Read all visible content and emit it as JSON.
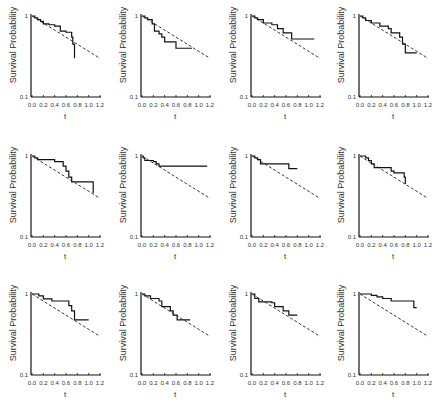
{
  "chart_data": [
    {
      "type": "line",
      "panel": 1,
      "ylabel": "Survival Probability",
      "xlabel": "t",
      "xticks": [
        "0.0",
        "0.2",
        "0.4",
        "0.6",
        "0.8",
        "1.0",
        "1.2"
      ],
      "yticks": [
        "0.1",
        "1"
      ],
      "yscale": "log",
      "xlim": [
        0,
        1.2
      ],
      "ylim": [
        0.1,
        1
      ],
      "series": [
        {
          "name": "Kaplan-Meier",
          "style": "solid",
          "x": [
            0,
            0.05,
            0.1,
            0.15,
            0.2,
            0.3,
            0.4,
            0.5,
            0.6,
            0.7,
            0.72,
            0.75
          ],
          "y": [
            1,
            0.95,
            0.9,
            0.86,
            0.8,
            0.78,
            0.75,
            0.65,
            0.63,
            0.55,
            0.45,
            0.3
          ]
        },
        {
          "name": "Exponential",
          "style": "dashed",
          "x": [
            0,
            1.2
          ],
          "y": [
            1,
            0.3
          ]
        }
      ]
    },
    {
      "type": "line",
      "panel": 2,
      "ylabel": "Survival Probability",
      "xlabel": "t",
      "xticks": [
        "0.0",
        "0.2",
        "0.4",
        "0.6",
        "0.8",
        "1.0",
        "1.2"
      ],
      "yticks": [
        "0.1",
        "1"
      ],
      "yscale": "log",
      "xlim": [
        0,
        1.2
      ],
      "ylim": [
        0.1,
        1
      ],
      "series": [
        {
          "name": "Kaplan-Meier",
          "style": "solid",
          "x": [
            0,
            0.05,
            0.1,
            0.18,
            0.22,
            0.3,
            0.35,
            0.4,
            0.6,
            0.88
          ],
          "y": [
            1,
            0.95,
            0.9,
            0.8,
            0.65,
            0.6,
            0.55,
            0.48,
            0.4,
            0.4
          ]
        },
        {
          "name": "Exponential",
          "style": "dashed",
          "x": [
            0,
            1.2
          ],
          "y": [
            1,
            0.3
          ]
        }
      ]
    },
    {
      "type": "line",
      "panel": 3,
      "ylabel": "Survival Probability",
      "xlabel": "t",
      "xticks": [
        "0.0",
        "0.2",
        "0.4",
        "0.6",
        "0.8",
        "1.0",
        "1.2"
      ],
      "yticks": [
        "0.1",
        "1"
      ],
      "yscale": "log",
      "xlim": [
        0,
        1.2
      ],
      "ylim": [
        0.1,
        1
      ],
      "series": [
        {
          "name": "Kaplan-Meier",
          "style": "solid",
          "x": [
            0,
            0.05,
            0.1,
            0.2,
            0.35,
            0.45,
            0.55,
            0.7,
            1.1
          ],
          "y": [
            1,
            0.95,
            0.9,
            0.82,
            0.78,
            0.7,
            0.62,
            0.52,
            0.52
          ]
        },
        {
          "name": "Exponential",
          "style": "dashed",
          "x": [
            0,
            1.2
          ],
          "y": [
            1,
            0.3
          ]
        }
      ]
    },
    {
      "type": "line",
      "panel": 4,
      "ylabel": "Survival Probability",
      "xlabel": "t",
      "xticks": [
        "0.0",
        "0.2",
        "0.4",
        "0.6",
        "0.8",
        "1.0",
        "1.2"
      ],
      "yticks": [
        "0.1",
        "1"
      ],
      "yscale": "log",
      "xlim": [
        0,
        1.2
      ],
      "ylim": [
        0.1,
        1
      ],
      "series": [
        {
          "name": "Kaplan-Meier",
          "style": "solid",
          "x": [
            0,
            0.05,
            0.1,
            0.2,
            0.35,
            0.5,
            0.55,
            0.7,
            0.75,
            0.8,
            1.0
          ],
          "y": [
            1,
            0.95,
            0.88,
            0.82,
            0.75,
            0.7,
            0.62,
            0.55,
            0.45,
            0.35,
            0.35
          ]
        },
        {
          "name": "Exponential",
          "style": "dashed",
          "x": [
            0,
            1.2
          ],
          "y": [
            1,
            0.3
          ]
        }
      ]
    },
    {
      "type": "line",
      "panel": 5,
      "ylabel": "Survival Probability",
      "xlabel": "t",
      "xticks": [
        "0.0",
        "0.2",
        "0.4",
        "0.6",
        "0.8",
        "1.0",
        "1.2"
      ],
      "yticks": [
        "0.1",
        "1"
      ],
      "yscale": "log",
      "xlim": [
        0,
        1.2
      ],
      "ylim": [
        0.1,
        1
      ],
      "series": [
        {
          "name": "Kaplan-Meier",
          "style": "solid",
          "x": [
            0,
            0.05,
            0.1,
            0.4,
            0.55,
            0.6,
            0.65,
            0.7,
            1.05,
            1.08
          ],
          "y": [
            1,
            0.95,
            0.9,
            0.85,
            0.75,
            0.65,
            0.55,
            0.48,
            0.48,
            0.35
          ]
        },
        {
          "name": "Exponential",
          "style": "dashed",
          "x": [
            0,
            1.2
          ],
          "y": [
            1,
            0.3
          ]
        }
      ]
    },
    {
      "type": "line",
      "panel": 6,
      "ylabel": "Survival Probability",
      "xlabel": "t",
      "xticks": [
        "0.0",
        "0.2",
        "0.4",
        "0.6",
        "0.8",
        "1.0",
        "1.2"
      ],
      "yticks": [
        "0.1",
        "1"
      ],
      "yscale": "log",
      "xlim": [
        0,
        1.2
      ],
      "ylim": [
        0.1,
        1
      ],
      "series": [
        {
          "name": "Kaplan-Meier",
          "style": "solid",
          "x": [
            0,
            0.02,
            0.05,
            0.2,
            0.25,
            0.3,
            1.15
          ],
          "y": [
            1,
            0.95,
            0.88,
            0.85,
            0.8,
            0.75,
            0.75
          ]
        },
        {
          "name": "Exponential",
          "style": "dashed",
          "x": [
            0,
            1.2
          ],
          "y": [
            1,
            0.3
          ]
        }
      ]
    },
    {
      "type": "line",
      "panel": 7,
      "ylabel": "Survival Probability",
      "xlabel": "t",
      "xticks": [
        "0.0",
        "0.2",
        "0.4",
        "0.6",
        "0.8",
        "1.0",
        "1.2"
      ],
      "yticks": [
        "0.1",
        "1"
      ],
      "yscale": "log",
      "xlim": [
        0,
        1.2
      ],
      "ylim": [
        0.1,
        1
      ],
      "series": [
        {
          "name": "Kaplan-Meier",
          "style": "solid",
          "x": [
            0,
            0.05,
            0.1,
            0.15,
            0.65,
            0.8
          ],
          "y": [
            1,
            0.95,
            0.9,
            0.8,
            0.7,
            0.7
          ]
        },
        {
          "name": "Exponential",
          "style": "dashed",
          "x": [
            0,
            1.2
          ],
          "y": [
            1,
            0.3
          ]
        }
      ]
    },
    {
      "type": "line",
      "panel": 8,
      "ylabel": "Survival Probability",
      "xlabel": "t",
      "xticks": [
        "0.0",
        "0.2",
        "0.4",
        "0.6",
        "0.8",
        "1.0",
        "1.2"
      ],
      "yticks": [
        "0.1",
        "1"
      ],
      "yscale": "log",
      "xlim": [
        0,
        1.2
      ],
      "ylim": [
        0.1,
        1
      ],
      "series": [
        {
          "name": "Kaplan-Meier",
          "style": "solid",
          "x": [
            0,
            0.1,
            0.15,
            0.2,
            0.25,
            0.55,
            0.6,
            0.78,
            0.8
          ],
          "y": [
            1,
            0.95,
            0.88,
            0.8,
            0.72,
            0.65,
            0.62,
            0.55,
            0.45
          ]
        },
        {
          "name": "Exponential",
          "style": "dashed",
          "x": [
            0,
            1.2
          ],
          "y": [
            1,
            0.3
          ]
        }
      ]
    },
    {
      "type": "line",
      "panel": 9,
      "ylabel": "Survival Probability",
      "xlabel": "t",
      "xticks": [
        "0.0",
        "0.2",
        "0.4",
        "0.6",
        "0.8",
        "1.0",
        "1.2"
      ],
      "yticks": [
        "0.1",
        "1"
      ],
      "yscale": "log",
      "xlim": [
        0,
        1.2
      ],
      "ylim": [
        0.1,
        1
      ],
      "series": [
        {
          "name": "Kaplan-Meier",
          "style": "solid",
          "x": [
            0,
            0.12,
            0.2,
            0.35,
            0.65,
            0.7,
            0.75,
            1.0
          ],
          "y": [
            1,
            0.95,
            0.87,
            0.82,
            0.72,
            0.62,
            0.48,
            0.48
          ]
        },
        {
          "name": "Exponential",
          "style": "dashed",
          "x": [
            0,
            1.2
          ],
          "y": [
            1,
            0.3
          ]
        }
      ]
    },
    {
      "type": "line",
      "panel": 10,
      "ylabel": "Survival Probability",
      "xlabel": "t",
      "xticks": [
        "0.0",
        "0.2",
        "0.4",
        "0.6",
        "0.8",
        "1.0",
        "1.2"
      ],
      "yticks": [
        "0.1",
        "1"
      ],
      "yscale": "log",
      "xlim": [
        0,
        1.2
      ],
      "ylim": [
        0.1,
        1
      ],
      "series": [
        {
          "name": "Kaplan-Meier",
          "style": "solid",
          "x": [
            0,
            0.05,
            0.15,
            0.3,
            0.35,
            0.5,
            0.55,
            0.62,
            0.85
          ],
          "y": [
            1,
            0.95,
            0.88,
            0.82,
            0.7,
            0.62,
            0.55,
            0.48,
            0.48
          ]
        },
        {
          "name": "Exponential",
          "style": "dashed",
          "x": [
            0,
            1.2
          ],
          "y": [
            1,
            0.3
          ]
        }
      ]
    },
    {
      "type": "line",
      "panel": 11,
      "ylabel": "Survival Probability",
      "xlabel": "t",
      "xticks": [
        "0.0",
        "0.2",
        "0.4",
        "0.6",
        "0.8",
        "1.0",
        "1.2"
      ],
      "yticks": [
        "0.1",
        "1"
      ],
      "yscale": "log",
      "xlim": [
        0,
        1.2
      ],
      "ylim": [
        0.1,
        1
      ],
      "series": [
        {
          "name": "Kaplan-Meier",
          "style": "solid",
          "x": [
            0,
            0.05,
            0.12,
            0.35,
            0.4,
            0.55,
            0.65,
            0.8
          ],
          "y": [
            1,
            0.88,
            0.8,
            0.78,
            0.7,
            0.62,
            0.55,
            0.55
          ]
        },
        {
          "name": "Exponential",
          "style": "dashed",
          "x": [
            0,
            1.2
          ],
          "y": [
            1,
            0.3
          ]
        }
      ]
    },
    {
      "type": "line",
      "panel": 12,
      "ylabel": "Survival Probability",
      "xlabel": "t",
      "xticks": [
        "0.0",
        "0.2",
        "0.4",
        "0.6",
        "0.8",
        "1.0",
        "1.2"
      ],
      "yticks": [
        "0.1",
        "1"
      ],
      "yscale": "log",
      "xlim": [
        0,
        1.2
      ],
      "ylim": [
        0.1,
        1
      ],
      "series": [
        {
          "name": "Kaplan-Meier",
          "style": "solid",
          "x": [
            0,
            0.2,
            0.3,
            0.4,
            0.55,
            0.95,
            1.0
          ],
          "y": [
            1,
            0.96,
            0.92,
            0.88,
            0.82,
            0.68,
            0.68
          ]
        },
        {
          "name": "Exponential",
          "style": "dashed",
          "x": [
            0,
            1.2
          ],
          "y": [
            1,
            0.3
          ]
        }
      ]
    }
  ]
}
